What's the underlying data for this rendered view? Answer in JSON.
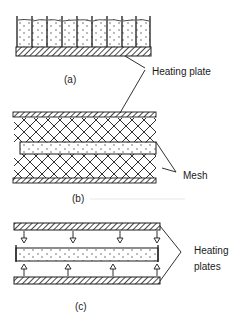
{
  "figure": {
    "panels": [
      {
        "id": "a",
        "caption": "(a)",
        "description": "Trays of product on a heating plate"
      },
      {
        "id": "b",
        "caption": "(b)",
        "description": "Product between mesh layers and heating plates"
      },
      {
        "id": "c",
        "caption": "(c)",
        "description": "Product between heating plates with heat flow arrows"
      }
    ],
    "labels": {
      "heating_plate": "Heating plate",
      "mesh": "Mesh",
      "heating_plates_line1": "Heating",
      "heating_plates_line2": "plates"
    },
    "colors": {
      "ink": "#1a1a1a",
      "background": "#ffffff"
    }
  }
}
